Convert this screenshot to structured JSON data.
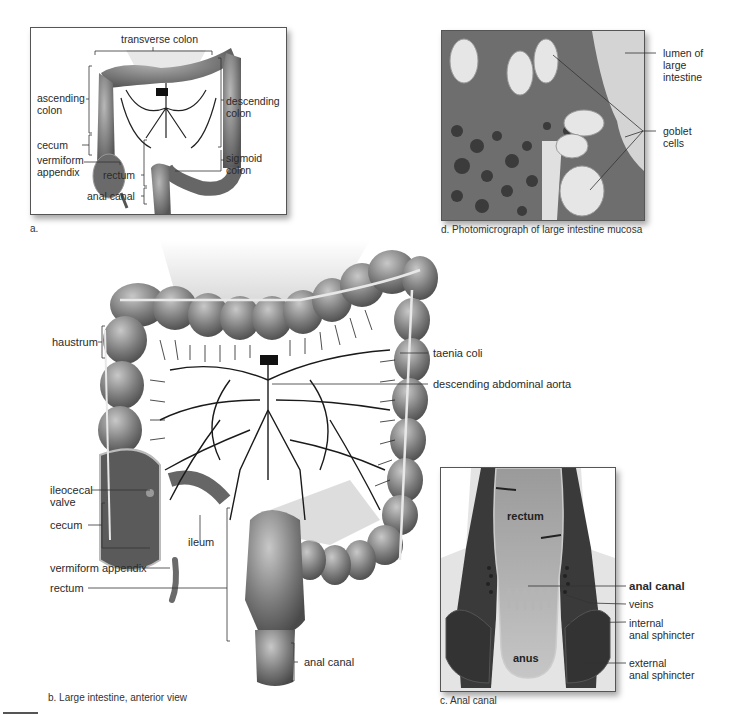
{
  "figure": {
    "panels": [
      {
        "id": "a",
        "caption": "a.",
        "labels": {
          "transverse_colon": "transverse colon",
          "ascending_colon_1": "ascending",
          "ascending_colon_2": "colon",
          "descending_colon_1": "descending",
          "descending_colon_2": "colon",
          "cecum": "cecum",
          "vermiform_appendix_1": "vermiform",
          "vermiform_appendix_2": "appendix",
          "sigmoid_colon_1": "sigmoid",
          "sigmoid_colon_2": "colon",
          "rectum": "rectum",
          "anal_canal": "anal canal"
        }
      },
      {
        "id": "b",
        "caption": "b. Large intestine, anterior view",
        "labels": {
          "haustrum": "haustrum",
          "taenia_coli": "taenia coli",
          "descending_abdominal_aorta": "descending abdominal aorta",
          "ileocecal_valve_1": "ileocecal",
          "ileocecal_valve_2": "valve",
          "cecum": "cecum",
          "ileum": "ileum",
          "vermiform_appendix": "vermiform appendix",
          "rectum": "rectum",
          "anal_canal": "anal canal"
        }
      },
      {
        "id": "c",
        "caption": "c. Anal canal",
        "labels": {
          "rectum": "rectum",
          "anus": "anus",
          "anal_canal": "anal canal",
          "veins": "veins",
          "internal_anal_sphincter_1": "internal",
          "internal_anal_sphincter_2": "anal sphincter",
          "external_anal_sphincter_1": "external",
          "external_anal_sphincter_2": "anal sphincter"
        }
      },
      {
        "id": "d",
        "caption": "d. Photomicrograph of large intestine mucosa",
        "labels": {
          "lumen_1": "lumen of",
          "lumen_2": "large",
          "lumen_3": "intestine",
          "goblet_1": "goblet",
          "goblet_2": "cells"
        }
      }
    ]
  }
}
